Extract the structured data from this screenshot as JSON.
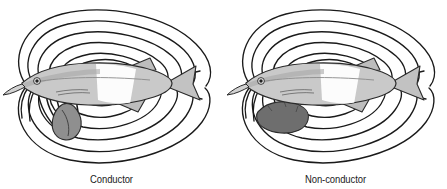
{
  "figure": {
    "background_color": "#ffffff",
    "line_color": "#1a1a1a",
    "panel_count": 2
  },
  "panels": [
    {
      "id": "conductor",
      "caption": "Conductor",
      "fish": {
        "name": "weakly-electric-fish",
        "body_fill": "#c9c9c9",
        "highlight_fill": "#ffffff",
        "outline_color": "#2a2a2a",
        "facing": "left",
        "eye_color": "#2a2a2a"
      },
      "object": {
        "name": "conductor-object",
        "fill": "#8a8a8a",
        "outline_color": "#2a2a2a",
        "effect": "field lines bend inward toward the object"
      },
      "field": {
        "name": "electric-field-lines",
        "line_count": 6,
        "distorted": true,
        "distortion": "converging"
      }
    },
    {
      "id": "nonconductor",
      "caption": "Non-conductor",
      "fish": {
        "name": "weakly-electric-fish",
        "body_fill": "#c9c9c9",
        "highlight_fill": "#ffffff",
        "outline_color": "#2a2a2a",
        "facing": "left",
        "eye_color": "#2a2a2a"
      },
      "object": {
        "name": "nonconductor-object",
        "fill": "#6e6e6e",
        "outline_color": "#2a2a2a",
        "effect": "field lines pass around the object undisturbed"
      },
      "field": {
        "name": "electric-field-lines",
        "line_count": 6,
        "distorted": false,
        "distortion": "none"
      }
    }
  ]
}
